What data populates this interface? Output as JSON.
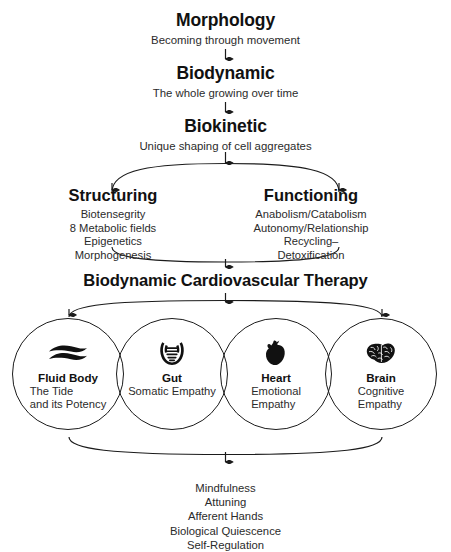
{
  "diagram": {
    "background_color": "#ffffff",
    "line_color": "#1b1b1b",
    "text_color": "#1a1a1a"
  },
  "tiers": [
    {
      "title": "Morphology",
      "subtitle": "Becoming through movement"
    },
    {
      "title": "Biodynamic",
      "subtitle": "The whole growing over time"
    },
    {
      "title": "Biokinetic",
      "subtitle": "Unique shaping of cell aggregates"
    }
  ],
  "branches": [
    {
      "title": "Structuring",
      "items": [
        "Biotensegrity",
        "8 Metabolic fields",
        "Epigenetics",
        "Morphogenesis"
      ]
    },
    {
      "title": "Functioning",
      "items": [
        "Anabolism/Catabolism",
        "Autonomy/Relationship",
        "Recycling–",
        "Detoxification"
      ]
    }
  ],
  "therapy": {
    "title": "Biodynamic Cardiovascular Therapy"
  },
  "circles": [
    {
      "icon": "wave-icon",
      "label": "Fluid Body",
      "description": [
        "The Tide",
        "and its Potency"
      ]
    },
    {
      "icon": "intestine-icon",
      "label": "Gut",
      "description": [
        "Somatic Empathy"
      ]
    },
    {
      "icon": "heart-icon",
      "label": "Heart",
      "description": [
        "Emotional",
        "Empathy"
      ]
    },
    {
      "icon": "brain-icon",
      "label": "Brain",
      "description": [
        "Cognitive",
        "Empathy"
      ]
    }
  ],
  "practices": [
    "Mindfulness",
    "Attuning",
    "Afferent Hands",
    "Biological Quiescence",
    "Self-Regulation"
  ]
}
